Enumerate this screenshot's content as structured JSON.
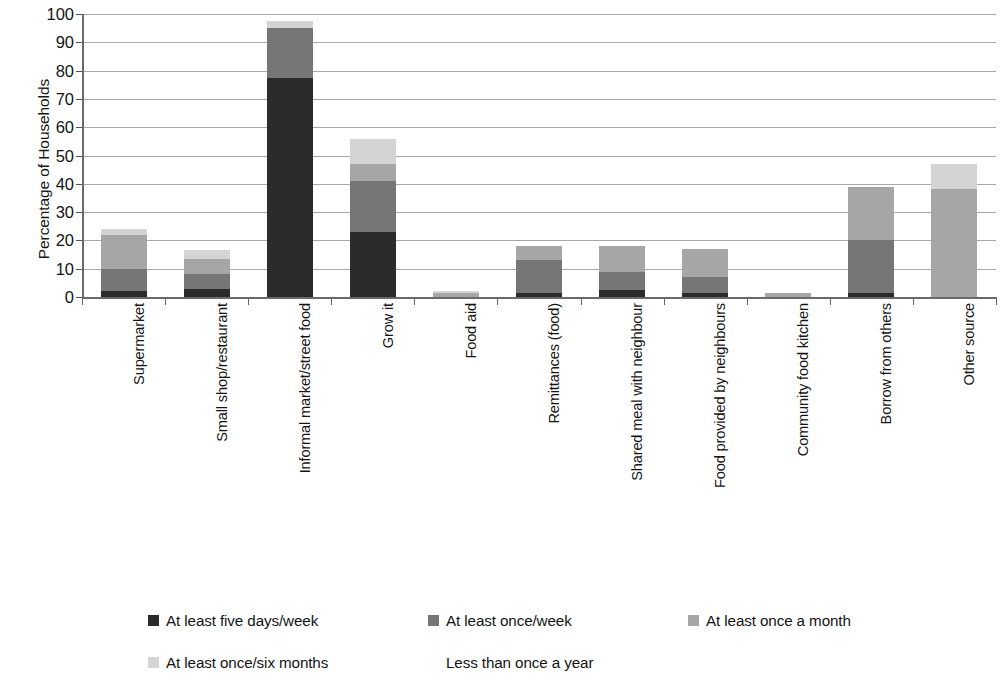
{
  "chart_data": {
    "type": "bar",
    "subtype": "stacked-column",
    "title": "",
    "xlabel": "",
    "ylabel": "Percentage of Households",
    "ylim": [
      0,
      100
    ],
    "y_ticks": [
      0,
      10,
      20,
      30,
      40,
      50,
      60,
      70,
      80,
      90,
      100
    ],
    "grid": "horizontal",
    "legend_position": "bottom",
    "categories": [
      "Supermarket",
      "Small shop/restaurant",
      "Informal market/street food",
      "Grow it",
      "Food aid",
      "Remittances (food)",
      "Shared meal with neighbour",
      "Food provided by neighbours",
      "Community food kitchen",
      "Borrow from others",
      "Other source"
    ],
    "series": [
      {
        "name": "At least five days/week",
        "color": "#2b2b2b",
        "values": [
          2.0,
          3.0,
          77.5,
          23.0,
          0.0,
          1.5,
          2.5,
          1.5,
          0.0,
          1.5,
          0.0
        ]
      },
      {
        "name": "At least once/week",
        "color": "#767676",
        "values": [
          8.0,
          5.0,
          17.5,
          18.0,
          0.0,
          11.5,
          6.5,
          5.5,
          0.0,
          18.5,
          0.0
        ]
      },
      {
        "name": "At least once a month",
        "color": "#a6a6a6",
        "values": [
          12.0,
          5.5,
          0.0,
          6.0,
          1.5,
          5.0,
          9.0,
          10.0,
          1.5,
          19.0,
          38.0
        ]
      },
      {
        "name": "At least once/six months",
        "color": "#d4d4d4",
        "values": [
          2.0,
          3.0,
          2.5,
          9.0,
          0.5,
          0.0,
          0.0,
          0.0,
          0.0,
          0.0,
          9.0
        ]
      },
      {
        "name": "Less than once a year",
        "color": "#ffffff",
        "values": [
          0.0,
          0.0,
          0.0,
          0.0,
          0.0,
          0.0,
          0.0,
          0.0,
          0.0,
          0.0,
          0.0
        ]
      }
    ],
    "totals": [
      24.0,
      16.5,
      97.5,
      56.0,
      2.0,
      18.0,
      18.0,
      17.0,
      1.5,
      39.0,
      47.0
    ]
  },
  "legend": {
    "items": [
      {
        "label": "At least five days/week",
        "color": "#2b2b2b",
        "swatch": "filled"
      },
      {
        "label": "At least once/week",
        "color": "#767676",
        "swatch": "filled"
      },
      {
        "label": "At least once a month",
        "color": "#a6a6a6",
        "swatch": "filled"
      },
      {
        "label": "At least once/six months",
        "color": "#d4d4d4",
        "swatch": "filled"
      },
      {
        "label": "Less than once a year",
        "color": "#ffffff",
        "swatch": "blank"
      }
    ]
  },
  "axes": {
    "y_title": "Percentage of Households"
  }
}
